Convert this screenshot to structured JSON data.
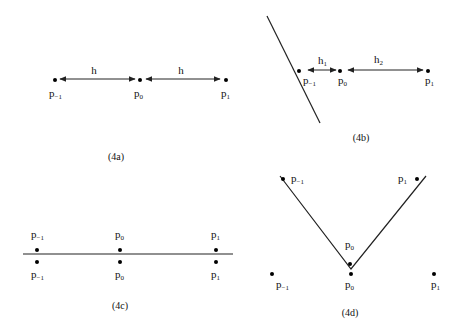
{
  "panels": {
    "a": {
      "caption": "(4a)",
      "points": [
        {
          "base": "p",
          "sub": "-1"
        },
        {
          "base": "p",
          "sub": "0"
        },
        {
          "base": "p",
          "sub": "1"
        }
      ],
      "spacings": [
        {
          "base": "h",
          "sub": ""
        },
        {
          "base": "h",
          "sub": ""
        }
      ]
    },
    "b": {
      "caption": "(4b)",
      "points": [
        {
          "base": "p",
          "sub": "-1"
        },
        {
          "base": "p",
          "sub": "0"
        },
        {
          "base": "p",
          "sub": "1"
        }
      ],
      "spacings": [
        {
          "base": "h",
          "sub": "1"
        },
        {
          "base": "h",
          "sub": "2"
        }
      ]
    },
    "c": {
      "caption": "(4c)",
      "top_points": [
        {
          "base": "p",
          "sub": "-1"
        },
        {
          "base": "p",
          "sub": "0"
        },
        {
          "base": "p",
          "sub": "1"
        }
      ],
      "bottom_points": [
        {
          "base": "p",
          "sub": "-1"
        },
        {
          "base": "p",
          "sub": "0"
        },
        {
          "base": "p",
          "sub": "1"
        }
      ]
    },
    "d": {
      "caption": "(4d)",
      "curve_points": [
        {
          "base": "p",
          "sub": "-1"
        },
        {
          "base": "p",
          "sub": "0"
        },
        {
          "base": "p",
          "sub": "1"
        }
      ],
      "bottom_points": [
        {
          "base": "p",
          "sub": "-1"
        },
        {
          "base": "p",
          "sub": "0"
        },
        {
          "base": "p",
          "sub": "1"
        }
      ]
    }
  }
}
